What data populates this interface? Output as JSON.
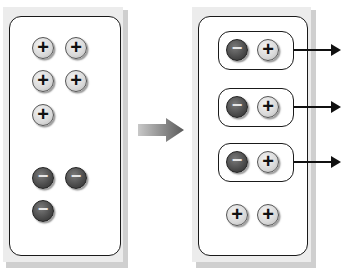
{
  "diagram": {
    "left_panel": {
      "label": "Before",
      "positive_ions": [
        {
          "symbol": "+",
          "x": 43,
          "y": 48
        },
        {
          "symbol": "+",
          "x": 76,
          "y": 48
        },
        {
          "symbol": "+",
          "x": 43,
          "y": 81
        },
        {
          "symbol": "+",
          "x": 76,
          "y": 81
        },
        {
          "symbol": "+",
          "x": 43,
          "y": 115
        }
      ],
      "negative_ions": [
        {
          "symbol": "−",
          "x": 43,
          "y": 178
        },
        {
          "symbol": "−",
          "x": 76,
          "y": 178
        },
        {
          "symbol": "−",
          "x": 43,
          "y": 211
        }
      ],
      "positive_count": 5,
      "negative_count": 3
    },
    "transition_arrow": {
      "icon": "right-arrow-icon",
      "color": "#6d6d6d"
    },
    "right_panel": {
      "label": "After",
      "pairs": [
        {
          "neg": "−",
          "pos": "+",
          "y": 50,
          "has_arrow": true
        },
        {
          "neg": "−",
          "pos": "+",
          "y": 107,
          "has_arrow": true
        },
        {
          "neg": "−",
          "pos": "+",
          "y": 162,
          "has_arrow": true
        }
      ],
      "leftover_positive": [
        {
          "symbol": "+",
          "x": 237,
          "y": 215
        },
        {
          "symbol": "+",
          "x": 268,
          "y": 215
        }
      ],
      "pair_count": 3,
      "leftover_count": 2
    },
    "colors": {
      "positive_fill": "#d8d8d8",
      "negative_fill": "#4a4a4a",
      "outline": "#1a1a1a",
      "shadow": "#cfcfcf"
    },
    "captions": {
      "left": "",
      "right": ""
    }
  }
}
